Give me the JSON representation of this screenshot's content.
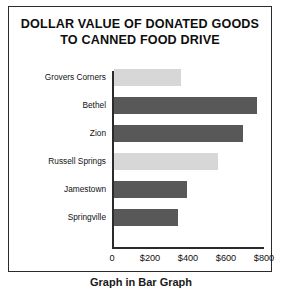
{
  "chart_data": {
    "type": "bar",
    "orientation": "horizontal",
    "title": "DOLLAR VALUE OF DONATED GOODS TO CANNED FOOD DRIVE",
    "title_lines": [
      "DOLLAR VALUE OF DONATED GOODS",
      "TO CANNED FOOD DRIVE"
    ],
    "xlabel": "",
    "ylabel": "",
    "categories": [
      "Grovers Corners",
      "Bethel",
      "Zion",
      "Russell Springs",
      "Jamestown",
      "Springville"
    ],
    "values": [
      355,
      755,
      680,
      550,
      385,
      340
    ],
    "bar_shades": [
      "light",
      "dark",
      "dark",
      "light",
      "dark",
      "dark"
    ],
    "xlim": [
      0,
      800
    ],
    "tick_values": [
      0,
      200,
      400,
      600,
      800
    ],
    "tick_labels": [
      "0",
      "$200",
      "$400",
      "$600",
      "$800"
    ],
    "grid": false,
    "legend": "none",
    "colors": {
      "light_bar": "#d7d7d7",
      "dark_bar": "#585858",
      "axis": "#2b2b2b",
      "frame": "#2b2b2b",
      "background": "#ffffff",
      "text": "#111111"
    }
  },
  "caption": "Graph in Bar Graph"
}
